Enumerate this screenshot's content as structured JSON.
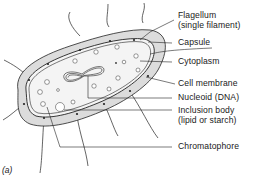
{
  "figure": {
    "panel_label": "(a)",
    "colors": {
      "capsule_fill": "#dcdcdc",
      "cytoplasm_fill": "#f4f4f4",
      "line": "#222222",
      "background": "#ffffff"
    }
  },
  "labels": [
    {
      "id": "flagellum",
      "line1": "Flagellum",
      "line2": "(single filament)"
    },
    {
      "id": "capsule",
      "line1": "Capsule"
    },
    {
      "id": "cytoplasm",
      "line1": "Cytoplasm"
    },
    {
      "id": "cell_membrane",
      "line1": "Cell membrane"
    },
    {
      "id": "nucleoid",
      "line1": "Nucleoid (DNA)"
    },
    {
      "id": "inclusion_body",
      "line1": "Inclusion body",
      "line2": "(lipid or starch)"
    },
    {
      "id": "chromatophore",
      "line1": "Chromatophore"
    }
  ]
}
